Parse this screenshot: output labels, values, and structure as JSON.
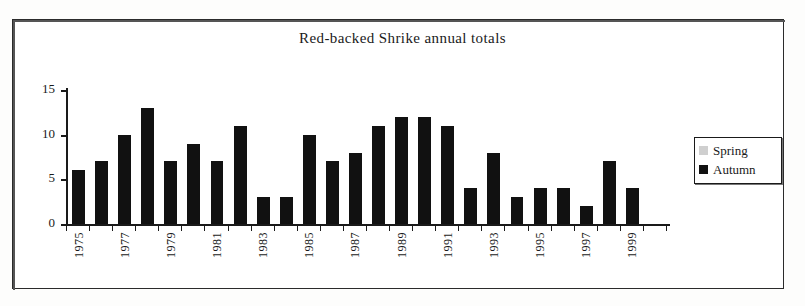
{
  "chart_data": {
    "type": "bar",
    "title": "Red-backed Shrike annual totals",
    "xlabel": "",
    "ylabel": "",
    "ylim": [
      0,
      15
    ],
    "yticks": [
      0,
      5,
      10,
      15
    ],
    "grid": false,
    "legend_position": "right",
    "bar_mode": "overlay",
    "categories": [
      "1975",
      "1976",
      "1977",
      "1978",
      "1979",
      "1980",
      "1981",
      "1982",
      "1983",
      "1984",
      "1985",
      "1986",
      "1987",
      "1988",
      "1989",
      "1990",
      "1991",
      "1992",
      "1993",
      "1994",
      "1995",
      "1996",
      "1997",
      "1998",
      "1999",
      "2000"
    ],
    "tick_labels": [
      "1975",
      "",
      "1977",
      "",
      "1979",
      "",
      "1981",
      "",
      "1983",
      "",
      "1985",
      "",
      "1987",
      "",
      "1989",
      "",
      "1991",
      "",
      "1993",
      "",
      "1995",
      "",
      "1997",
      "",
      "1999",
      ""
    ],
    "series": [
      {
        "name": "Spring",
        "color": "#cfcfcf",
        "values": [
          0,
          0,
          1,
          0,
          0,
          1,
          0,
          0,
          1,
          0,
          1,
          2,
          1,
          2,
          0,
          0,
          2,
          2,
          0,
          2,
          2,
          0,
          0,
          3,
          3,
          0
        ]
      },
      {
        "name": "Autumn",
        "color": "#111111",
        "values": [
          6,
          7,
          10,
          13,
          7,
          9,
          7,
          11,
          3,
          3,
          10,
          7,
          8,
          11,
          12,
          12,
          11,
          4,
          8,
          3,
          4,
          4,
          2,
          7,
          4,
          0
        ]
      }
    ]
  },
  "legend": {
    "items": [
      {
        "label": "Spring"
      },
      {
        "label": "Autumn"
      }
    ]
  }
}
